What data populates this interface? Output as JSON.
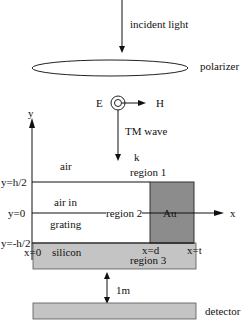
{
  "labels": {
    "incident_light": "incident light",
    "polarizer": "polarizer",
    "e_field": "E",
    "h_field": "H",
    "tm_wave": "TM wave",
    "k_vector": "k",
    "y_axis": "y",
    "x_axis": "x",
    "air": "air",
    "region1": "region 1",
    "y_top": "y=h/2",
    "y_zero": "y=0",
    "y_bottom": "y=-h/2",
    "air_in": "air in",
    "grating": "grating",
    "region2": "region 2",
    "au": "Au",
    "x_zero": "x=0",
    "silicon": "silicon",
    "x_d": "x=d",
    "x_t": "x=t",
    "region3": "region 3",
    "distance": "1m",
    "detector": "detector"
  },
  "colors": {
    "au_fill": "#8c8c8c",
    "silicon_fill": "#c4c4c4",
    "detector_fill": "#c4c4c4",
    "line": "#111111"
  }
}
